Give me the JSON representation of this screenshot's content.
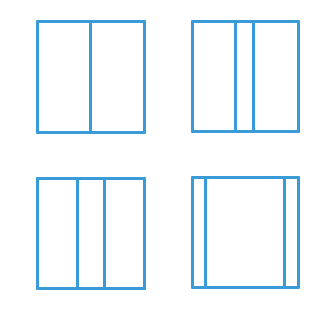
{
  "diagram": {
    "stroke_color": "#3a9bd9",
    "stroke_width": 3,
    "background": "#ffffff",
    "figures": [
      {
        "id": "top-left",
        "x": 36,
        "y": 20,
        "w": 110,
        "h": 114,
        "dividers": [
          90
        ]
      },
      {
        "id": "top-right",
        "x": 191,
        "y": 20,
        "w": 109,
        "h": 113,
        "dividers": [
          235,
          253
        ]
      },
      {
        "id": "bottom-left",
        "x": 36,
        "y": 177,
        "w": 110,
        "h": 113,
        "dividers": [
          77,
          104
        ]
      },
      {
        "id": "bottom-right",
        "x": 191,
        "y": 176,
        "w": 109,
        "h": 113,
        "dividers": [
          205,
          284
        ]
      }
    ]
  }
}
